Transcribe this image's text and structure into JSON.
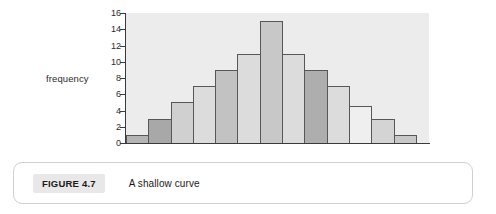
{
  "figure": {
    "badge_label": "FIGURE 4.7",
    "caption": "A shallow curve"
  },
  "chart_data": {
    "type": "bar",
    "title": "",
    "subtitle": "",
    "xlabel": "",
    "ylabel": "frequency",
    "ylim": [
      0,
      16
    ],
    "y_ticks": [
      16,
      14,
      12,
      10,
      8,
      6,
      4,
      2,
      0
    ],
    "grid": false,
    "legend": "none",
    "categories": [
      "1",
      "2",
      "3",
      "4",
      "5",
      "6",
      "7",
      "8",
      "9",
      "10",
      "11",
      "12",
      "13"
    ],
    "values": [
      1,
      3,
      5,
      7,
      9,
      11,
      15,
      11,
      9,
      7,
      4.5,
      3,
      1
    ],
    "bar_colors": [
      "#b4b4b4",
      "#a8a8a8",
      "#d0d0d0",
      "#dcdcdc",
      "#c2c2c2",
      "#dcdcdc",
      "#c8c8c8",
      "#dcdcdc",
      "#aeaeae",
      "#dcdcdc",
      "#efefef",
      "#d4d4d4",
      "#c8c8c8"
    ],
    "plot_background": "#ececec",
    "axis_color": "#3a3a3a",
    "bar_border_color": "#575757"
  }
}
